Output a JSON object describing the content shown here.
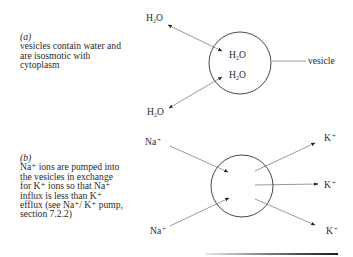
{
  "part_a": {
    "label": "(a)",
    "lines": [
      "vesicles contain water and",
      "are isosmotic with",
      "cytoplasm"
    ],
    "species": {
      "outside_top": "H",
      "outside_bottom": "H",
      "inside_top": "H",
      "inside_bottom": "H",
      "subscript": "2",
      "suffix": "O"
    },
    "vesicle_label": "vesicle"
  },
  "part_b": {
    "label": "(b)",
    "lines": [
      "Na⁺ ions are pumped into",
      "the vesicles in exchange",
      "for K⁺ ions so that Na⁺",
      "influx is less than K⁺",
      "efflux (see Na⁺/ K⁺ pump,",
      "section 7.2.2)"
    ],
    "in_ion": {
      "symbol": "Na",
      "charge": "+"
    },
    "out_ion": {
      "symbol": "K",
      "charge": "+"
    }
  },
  "colors": {
    "ink": "#2a2a2a",
    "line": "#555555",
    "rule_dark": "#222222",
    "rule_light": "#e0e0e0"
  }
}
